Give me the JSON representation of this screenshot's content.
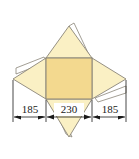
{
  "figure": {
    "name": "pyramid-net-diagram",
    "type": "technical-drawing"
  },
  "colors": {
    "square_fill": "#f3d98f",
    "triangle_fill": "#faf0c4",
    "tab_fill": "#ffffff",
    "outline": "#8a8578",
    "dimension_line": "#1a1a1a",
    "text": "#1a1a1a",
    "background": "#ffffff"
  },
  "shapes": {
    "center_square": {
      "label": "center-square",
      "fill": "#f3d98f"
    },
    "top_triangle": {
      "label": "top-triangle",
      "fill": "#faf0c4"
    },
    "bottom_triangle": {
      "label": "bottom-triangle",
      "fill": "#faf0c4"
    },
    "left_triangle": {
      "label": "left-triangle",
      "fill": "#faf0c4"
    },
    "right_triangle": {
      "label": "right-triangle",
      "fill": "#faf0c4"
    },
    "top_tab": {
      "label": "top-glue-tab",
      "fill": "#ffffff"
    },
    "bottom_tab": {
      "label": "bottom-glue-tab",
      "fill": "#ffffff"
    },
    "left_tab": {
      "label": "left-glue-tab",
      "fill": "#ffffff"
    },
    "right_tab": {
      "label": "right-glue-tab",
      "fill": "#ffffff"
    }
  },
  "dimensions": [
    {
      "id": "left",
      "value": "185"
    },
    {
      "id": "center",
      "value": "230"
    },
    {
      "id": "right",
      "value": "185"
    }
  ]
}
